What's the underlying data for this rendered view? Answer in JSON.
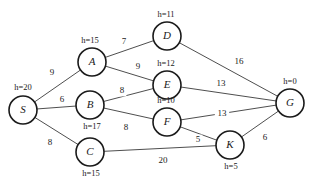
{
  "figure": {
    "type": "weighted-undirected-graph"
  },
  "chart_data": {
    "type": "diagram",
    "title": "",
    "graph_type": "weighted undirected graph with heuristics",
    "nodes": [
      {
        "id": "S",
        "label": "S",
        "heuristic_label": "h=20",
        "heuristic": 20,
        "x": 23,
        "y": 110,
        "r": 14,
        "h_label_x": 23,
        "h_label_y": 88
      },
      {
        "id": "A",
        "label": "A",
        "heuristic_label": "h=15",
        "heuristic": 15,
        "x": 92,
        "y": 62,
        "r": 14,
        "h_label_x": 90,
        "h_label_y": 41
      },
      {
        "id": "B",
        "label": "B",
        "heuristic_label": "h=17",
        "heuristic": 17,
        "x": 90,
        "y": 105,
        "r": 14,
        "h_label_x": 92,
        "h_label_y": 127
      },
      {
        "id": "C",
        "label": "C",
        "heuristic_label": "h=15",
        "heuristic": 15,
        "x": 90,
        "y": 152,
        "r": 14,
        "h_label_x": 91,
        "h_label_y": 174
      },
      {
        "id": "D",
        "label": "D",
        "heuristic_label": "h=11",
        "heuristic": 11,
        "x": 167,
        "y": 36,
        "r": 14,
        "h_label_x": 166,
        "h_label_y": 15
      },
      {
        "id": "E",
        "label": "E",
        "heuristic_label": "h=12",
        "heuristic": 12,
        "x": 167,
        "y": 85,
        "r": 14,
        "h_label_x": 166,
        "h_label_y": 64
      },
      {
        "id": "F",
        "label": "F",
        "heuristic_label": "h=10",
        "heuristic": 10,
        "x": 167,
        "y": 122,
        "r": 14,
        "h_label_x": 166,
        "h_label_y": 101
      },
      {
        "id": "K",
        "label": "K",
        "heuristic_label": "h=5",
        "heuristic": 5,
        "x": 230,
        "y": 145,
        "r": 14,
        "h_label_x": 231,
        "h_label_y": 167
      },
      {
        "id": "G",
        "label": "G",
        "heuristic_label": "h=0",
        "heuristic": 0,
        "x": 290,
        "y": 103,
        "r": 14,
        "h_label_x": 290,
        "h_label_y": 82
      }
    ],
    "edges": [
      {
        "from": "S",
        "to": "A",
        "weight": 9,
        "label": "9",
        "label_x": 52,
        "label_y": 73
      },
      {
        "from": "S",
        "to": "B",
        "weight": 6,
        "label": "6",
        "label_x": 62,
        "label_y": 100
      },
      {
        "from": "S",
        "to": "C",
        "weight": 8,
        "label": "8",
        "label_x": 50,
        "label_y": 143
      },
      {
        "from": "A",
        "to": "D",
        "weight": 7,
        "label": "7",
        "label_x": 124,
        "label_y": 42
      },
      {
        "from": "A",
        "to": "E",
        "weight": 9,
        "label": "9",
        "label_x": 138,
        "label_y": 67
      },
      {
        "from": "B",
        "to": "E",
        "weight": 8,
        "label": "8",
        "label_x": 122,
        "label_y": 91
      },
      {
        "from": "B",
        "to": "F",
        "weight": 8,
        "label": "8",
        "label_x": 126,
        "label_y": 128
      },
      {
        "from": "D",
        "to": "G",
        "weight": 16,
        "label": "16",
        "label_x": 239,
        "label_y": 62
      },
      {
        "from": "E",
        "to": "G",
        "weight": 13,
        "label": "13",
        "label_x": 221,
        "label_y": 84
      },
      {
        "from": "F",
        "to": "G",
        "weight": 13,
        "label": "13",
        "label_x": 222,
        "label_y": 114
      },
      {
        "from": "F",
        "to": "K",
        "weight": 5,
        "label": "5",
        "label_x": 198,
        "label_y": 140
      },
      {
        "from": "C",
        "to": "K",
        "weight": 20,
        "label": "20",
        "label_x": 163,
        "label_y": 161
      },
      {
        "from": "K",
        "to": "G",
        "weight": 6,
        "label": "6",
        "label_x": 265,
        "label_y": 138
      }
    ],
    "colors": {
      "node_stroke": "#1a1a1a",
      "node_fill": "#ffffff",
      "edge_stroke": "#3a3a3a",
      "text": "#1a1a1a",
      "background": "#ffffff"
    }
  }
}
